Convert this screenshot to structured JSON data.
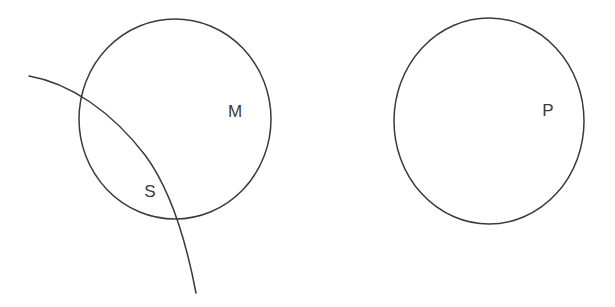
{
  "diagram": {
    "type": "venn-euler-diagram",
    "background_color": "#ffffff",
    "stroke_color": "#3a3a3a",
    "stroke_width": 1.5,
    "canvas": {
      "width": 615,
      "height": 307
    },
    "labels": {
      "middle_term": "M",
      "subject_term": "S",
      "predicate_term": "P"
    },
    "shapes": [
      {
        "name": "circle-m",
        "kind": "ellipse",
        "label": "M",
        "cx": 175,
        "cy": 119,
        "rx": 96,
        "ry": 100,
        "label_x": 235,
        "label_y": 113
      },
      {
        "name": "arc-s",
        "kind": "open-arc",
        "label": "S",
        "path": "M 29 76 C 70 83 112 112 145 155 C 168 186 185 235 196 293",
        "label_x": 150,
        "label_y": 193
      },
      {
        "name": "circle-p",
        "kind": "ellipse",
        "label": "P",
        "cx": 489,
        "cy": 121,
        "rx": 95,
        "ry": 103,
        "label_x": 548,
        "label_y": 112
      }
    ]
  }
}
